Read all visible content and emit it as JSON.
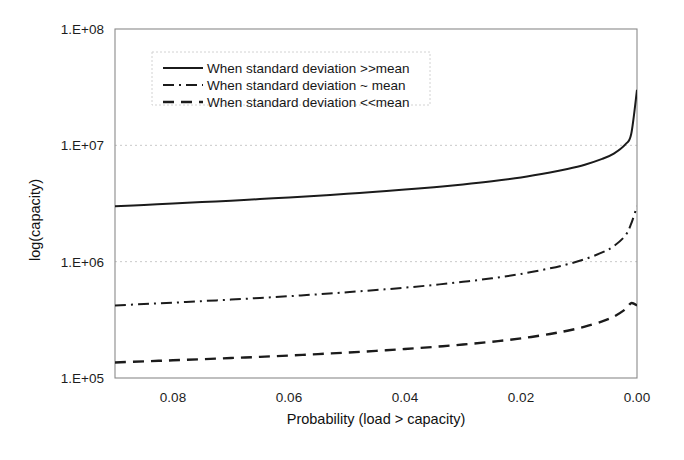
{
  "chart_data": {
    "type": "line",
    "title": "",
    "xlabel": "Probability (load > capacity)",
    "ylabel": "log(capacity)",
    "xlim": [
      0.09,
      0.0
    ],
    "ylim": [
      100000,
      100000000
    ],
    "y_scale": "log",
    "x_reversed": true,
    "grid": true,
    "legend_position": "top-center",
    "x_ticks": [
      "0.08",
      "0.06",
      "0.04",
      "0.02",
      "0.00"
    ],
    "x_tick_values": [
      0.08,
      0.06,
      0.04,
      0.02,
      0.0
    ],
    "y_ticks": [
      "1.E+08",
      "1.E+07",
      "1.E+06",
      "1.E+05"
    ],
    "y_tick_values": [
      100000000,
      10000000,
      1000000,
      100000
    ],
    "series": [
      {
        "name": "When standard deviation >>mean",
        "style": "solid",
        "dash": "none",
        "width": 2.0,
        "color": "#1b1b1b",
        "x": [
          0.09,
          0.085,
          0.08,
          0.075,
          0.07,
          0.065,
          0.06,
          0.055,
          0.05,
          0.045,
          0.04,
          0.035,
          0.03,
          0.025,
          0.02,
          0.015,
          0.012,
          0.009,
          0.006,
          0.004,
          0.002,
          0.001,
          0.0
        ],
        "values": [
          3000000,
          3075000,
          3160000,
          3250000,
          3345000,
          3450000,
          3565000,
          3690000,
          3830000,
          3985000,
          4165000,
          4370000,
          4615000,
          4915000,
          5300000,
          5840000,
          6260000,
          6820000,
          7650000,
          8500000,
          10200000,
          12500000,
          30000000
        ]
      },
      {
        "name": "When standard deviation ~ mean",
        "style": "dash-dot",
        "dash": "11 5 2 5",
        "width": 2.0,
        "color": "#1b1b1b",
        "x": [
          0.09,
          0.085,
          0.08,
          0.075,
          0.07,
          0.065,
          0.06,
          0.055,
          0.05,
          0.045,
          0.04,
          0.035,
          0.03,
          0.025,
          0.02,
          0.015,
          0.012,
          0.009,
          0.006,
          0.004,
          0.002,
          0.001,
          0.0
        ],
        "values": [
          420000,
          432000,
          444000,
          458000,
          472000,
          488000,
          505000,
          524000,
          546000,
          570000,
          598000,
          631000,
          671000,
          720000,
          784000,
          876000,
          950000,
          1050000,
          1200000,
          1360000,
          1680000,
          2120000,
          3000000
        ]
      },
      {
        "name": "When standard deviation <<mean",
        "style": "dashed",
        "dash": "11 7",
        "width": 2.4,
        "color": "#1b1b1b",
        "x": [
          0.09,
          0.085,
          0.08,
          0.075,
          0.07,
          0.065,
          0.06,
          0.055,
          0.05,
          0.045,
          0.04,
          0.035,
          0.03,
          0.025,
          0.02,
          0.015,
          0.012,
          0.009,
          0.006,
          0.004,
          0.002,
          0.001,
          0.0
        ],
        "values": [
          136000,
          139000,
          142000,
          145000,
          148500,
          152000,
          156000,
          160500,
          165500,
          171000,
          177500,
          185000,
          194000,
          205000,
          219000,
          239000,
          255000,
          276000,
          307000,
          337000,
          390000,
          440000,
          420000
        ]
      }
    ]
  },
  "legend": {
    "entries": [
      {
        "label": "When standard deviation >>mean",
        "style": "solid"
      },
      {
        "label": "When standard deviation ~ mean",
        "style": "dash-dot"
      },
      {
        "label": "When standard deviation <<mean",
        "style": "dashed"
      }
    ]
  },
  "colors": {
    "series": "#1b1b1b",
    "axis": "#8a8a8a",
    "grid": "#c9c9c9",
    "text": "#1a1a1a",
    "background": "#ffffff"
  }
}
